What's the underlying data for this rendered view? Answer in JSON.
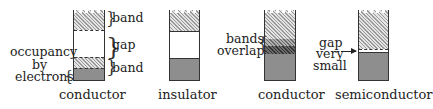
{
  "diagram": {
    "panels": [
      {
        "caption": "conductor",
        "labels": {
          "upper_band": "band",
          "gap": "gap",
          "lower_band": "band",
          "occupancy_line1": "occupancy",
          "occupancy_line2": "by",
          "occupancy_line3": "electrons"
        }
      },
      {
        "caption": "insulator"
      },
      {
        "caption": "conductor",
        "labels": {
          "overlap_line1": "bands",
          "overlap_line2": "overlap"
        }
      },
      {
        "caption": "semiconductor",
        "labels": {
          "gap_line1": "gap",
          "gap_line2": "very",
          "gap_line3": "small"
        }
      }
    ],
    "legend": {
      "hatched": "band (empty)",
      "filled": "band occupied by electrons",
      "white": "gap"
    }
  }
}
